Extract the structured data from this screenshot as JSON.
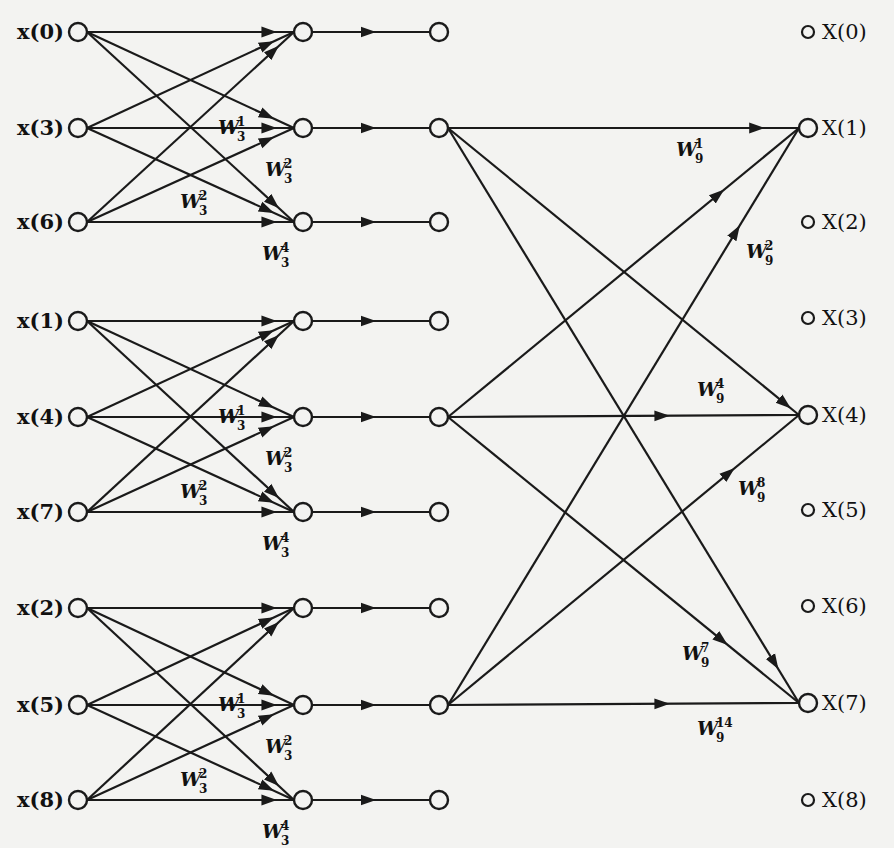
{
  "figure": {
    "background": "#f3f3f1",
    "ink": "#1a1a1a"
  },
  "inputs": [
    {
      "label": "x(0)",
      "group": 0,
      "row": 0
    },
    {
      "label": "x(3)",
      "group": 0,
      "row": 1
    },
    {
      "label": "x(6)",
      "group": 0,
      "row": 2
    },
    {
      "label": "x(1)",
      "group": 1,
      "row": 0
    },
    {
      "label": "x(4)",
      "group": 1,
      "row": 1
    },
    {
      "label": "x(7)",
      "group": 1,
      "row": 2
    },
    {
      "label": "x(2)",
      "group": 2,
      "row": 0
    },
    {
      "label": "x(5)",
      "group": 2,
      "row": 1
    },
    {
      "label": "x(8)",
      "group": 2,
      "row": 2
    }
  ],
  "outputs": [
    {
      "label": "X(0)"
    },
    {
      "label": "X(1)"
    },
    {
      "label": "X(2)"
    },
    {
      "label": "X(3)"
    },
    {
      "label": "X(4)"
    },
    {
      "label": "X(5)"
    },
    {
      "label": "X(6)"
    },
    {
      "label": "X(7)"
    },
    {
      "label": "X(8)"
    }
  ],
  "stage1_twiddles": {
    "labels": [
      {
        "base": "W",
        "sub": "3",
        "sup": "1"
      },
      {
        "base": "W",
        "sub": "3",
        "sup": "2"
      },
      {
        "base": "W",
        "sub": "3",
        "sup": "2"
      },
      {
        "base": "W",
        "sub": "3",
        "sup": "4"
      }
    ]
  },
  "stage2_twiddles": [
    {
      "base": "W",
      "sub": "9",
      "sup": "1"
    },
    {
      "base": "W",
      "sub": "9",
      "sup": "2"
    },
    {
      "base": "W",
      "sub": "9",
      "sup": "4"
    },
    {
      "base": "W",
      "sub": "9",
      "sup": "8"
    },
    {
      "base": "W",
      "sub": "9",
      "sup": "7"
    },
    {
      "base": "W",
      "sub": "9",
      "sup": "14"
    }
  ]
}
